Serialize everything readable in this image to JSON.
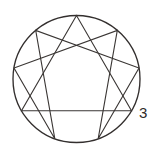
{
  "figure": {
    "name": "enneagram-symbol",
    "background_color": "#ffffff",
    "stroke_color": "#3a3634",
    "ring_stroke_color": "#332f2e",
    "label_color": "#2e2b2a",
    "canvas": {
      "width": 157,
      "height": 154
    }
  },
  "circle": {
    "name": "enneagram-circle",
    "cx": 76.5,
    "cy": 79.0,
    "r": 63.5,
    "stroke_width": 1.35
  },
  "points": [
    {
      "number": "9",
      "angle_deg": 0,
      "x": 76.5,
      "y": 15.5
    },
    {
      "number": "1",
      "angle_deg": 40,
      "x": 117.3,
      "y": 30.4
    },
    {
      "number": "2",
      "angle_deg": 80,
      "x": 139.0,
      "y": 68.0
    },
    {
      "number": "3",
      "angle_deg": 120,
      "x": 131.5,
      "y": 110.8
    },
    {
      "number": "4",
      "angle_deg": 160,
      "x": 98.2,
      "y": 138.7
    },
    {
      "number": "5",
      "angle_deg": 200,
      "x": 54.8,
      "y": 138.7
    },
    {
      "number": "6",
      "angle_deg": 240,
      "x": 21.5,
      "y": 110.8
    },
    {
      "number": "7",
      "angle_deg": 280,
      "x": 14.0,
      "y": 68.0
    },
    {
      "number": "8",
      "angle_deg": 320,
      "x": 35.7,
      "y": 30.4
    }
  ],
  "triangle": {
    "name": "enneagram-triangle-963",
    "vertex_numbers": [
      "9",
      "6",
      "3"
    ],
    "path": "M 76.5,15.5 L 21.5,110.8 L 131.5,110.8 Z"
  },
  "hexad": {
    "name": "enneagram-hexad-142857",
    "vertex_numbers": [
      "1",
      "4",
      "2",
      "8",
      "5",
      "7"
    ],
    "path": "M 117.3,30.4 L 98.2,138.7 L 139.0,68.0 L 35.7,30.4 L 54.8,138.7 L 14.0,68.0 Z"
  },
  "labels": [
    {
      "name": "point-label-3",
      "text": "3",
      "x": 139,
      "y": 105
    }
  ]
}
